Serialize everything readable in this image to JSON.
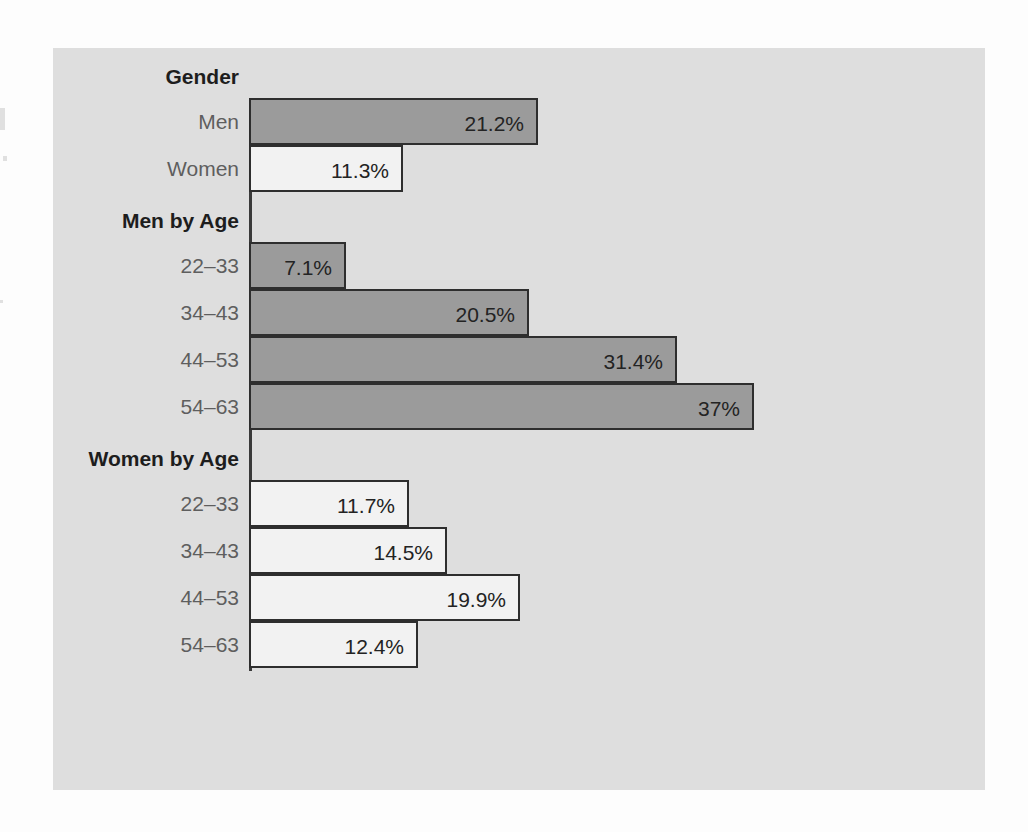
{
  "chart_data": {
    "type": "bar",
    "orientation": "horizontal",
    "title": "",
    "subtitle": "",
    "xlabel": "",
    "ylabel": "",
    "grid": false,
    "legend": false,
    "value_suffix": "%",
    "xlim": [
      0,
      39.6
    ],
    "axis_visible_side": "left",
    "groups": [
      {
        "id": "gender",
        "header": "Gender",
        "categories": [
          "Men",
          "Women"
        ],
        "values": [
          21.2,
          11.3
        ],
        "labels": [
          "21.2%",
          "11.3%"
        ],
        "series": [
          "men",
          "women"
        ]
      },
      {
        "id": "men-by-age",
        "header": "Men by Age",
        "categories": [
          "22–33",
          "34–43",
          "44–53",
          "54–63"
        ],
        "values": [
          7.1,
          20.5,
          31.4,
          37
        ],
        "labels": [
          "7.1%",
          "20.5%",
          "31.4%",
          "37%"
        ],
        "series": [
          "men",
          "men",
          "men",
          "men"
        ]
      },
      {
        "id": "women-by-age",
        "header": "Women by Age",
        "categories": [
          "22–33",
          "34–43",
          "44–53",
          "54–63"
        ],
        "values": [
          11.7,
          14.5,
          19.9,
          12.4
        ],
        "labels": [
          "11.7%",
          "14.5%",
          "19.9%",
          "12.4%"
        ],
        "series": [
          "women",
          "women",
          "women",
          "women"
        ]
      }
    ],
    "colors": {
      "men_fill": "#9b9b9b",
      "women_fill": "#f2f2f2",
      "bar_outline": "#2e2e2e",
      "panel_background": "#dedede",
      "page_background": "#fdfdfd",
      "header_text": "#1d1d1d",
      "category_text": "#5e5e5e",
      "value_text": "#232323",
      "axis": "#3a3a3a"
    }
  }
}
